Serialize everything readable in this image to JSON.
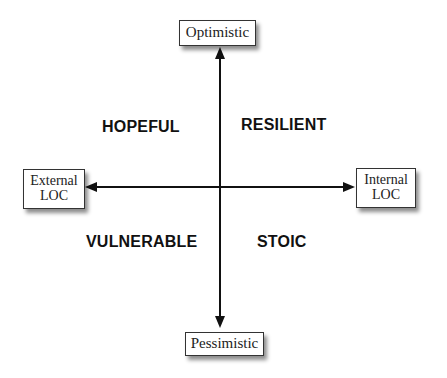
{
  "diagram": {
    "type": "quadrant",
    "axes": {
      "vertical": {
        "top_label": "Optimistic",
        "bottom_label": "Pessimistic"
      },
      "horizontal": {
        "left_label_line1": "External",
        "left_label_line2": "LOC",
        "right_label_line1": "Internal",
        "right_label_line2": "LOC"
      }
    },
    "quadrants": {
      "top_left": "HOPEFUL",
      "top_right": "RESILIENT",
      "bottom_left": "VULNERABLE",
      "bottom_right": "STOIC"
    },
    "colors": {
      "line": "#111111",
      "box_border": "#333333",
      "text": "#111111",
      "background": "#ffffff"
    }
  }
}
